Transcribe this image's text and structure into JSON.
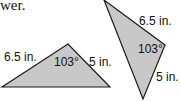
{
  "lead_text": "wer.",
  "triangles": [
    {
      "side_a": "6.5 in.",
      "side_b": "5 in.",
      "angle": "103°"
    },
    {
      "side_a": "6.5 in.",
      "side_b": "5 in.",
      "angle": "103°"
    }
  ],
  "colors": {
    "fill": "#c8c8c8",
    "stroke": "#1a1a1a"
  }
}
